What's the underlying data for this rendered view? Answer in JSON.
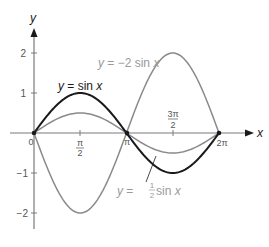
{
  "chart_data": {
    "type": "line",
    "title": "",
    "xlabel": "x",
    "ylabel": "y",
    "xlim": [
      0,
      6.9
    ],
    "ylim": [
      -2.4,
      2.6
    ],
    "x_ticks": [
      {
        "value": 0,
        "label": "0"
      },
      {
        "value": 1.5708,
        "label": "π/2"
      },
      {
        "value": 3.1416,
        "label": "π"
      },
      {
        "value": 4.7124,
        "label": "3π/2"
      },
      {
        "value": 6.2832,
        "label": "2π"
      }
    ],
    "y_ticks": [
      {
        "value": 2,
        "label": "2"
      },
      {
        "value": 1,
        "label": "1"
      },
      {
        "value": -1,
        "label": "−1"
      },
      {
        "value": -2,
        "label": "−2"
      }
    ],
    "x": [
      0,
      0.7854,
      1.5708,
      2.3562,
      3.1416,
      3.927,
      4.7124,
      5.4978,
      6.2832
    ],
    "series": [
      {
        "name": "y = sin x",
        "color": "#1a1a1a",
        "amplitude": 1,
        "values": [
          0,
          0.707,
          1,
          0.707,
          0,
          -0.707,
          -1,
          -0.707,
          0
        ]
      },
      {
        "name": "y = −2 sin x",
        "color": "#8a8a8a",
        "amplitude": -2,
        "values": [
          0,
          -1.414,
          -2,
          -1.414,
          0,
          1.414,
          2,
          1.414,
          0
        ]
      },
      {
        "name": "y = ½ sin x",
        "color": "#8a8a8a",
        "amplitude": 0.5,
        "values": [
          0,
          0.354,
          0.5,
          0.354,
          0,
          -0.354,
          -0.5,
          -0.354,
          0
        ]
      }
    ],
    "annotations": [
      {
        "text_parts": [
          "y",
          " = sin ",
          "x"
        ],
        "for": "y = sin x"
      },
      {
        "text_parts": [
          "y",
          " = −2 sin ",
          "x"
        ],
        "for": "y = −2 sin x"
      },
      {
        "text_parts": [
          "y",
          " = ",
          "1",
          "2",
          " sin ",
          "x"
        ],
        "for": "y = ½ sin x"
      }
    ],
    "points": [
      {
        "x": 0,
        "y": 0
      },
      {
        "x": 3.1416,
        "y": 0
      },
      {
        "x": 6.2832,
        "y": 0
      }
    ],
    "grid": false,
    "legend": "none (inline labels)"
  },
  "axis": {
    "x_label": "x",
    "y_label": "y"
  },
  "labels": {
    "sin": {
      "y": "y",
      "eq": " = sin ",
      "x": "x"
    },
    "neg2": {
      "y": "y",
      "eq": " = −2 sin ",
      "x": "x"
    },
    "half": {
      "y": "y",
      "eq": " = ",
      "num": "1",
      "den": "2",
      "sin": " sin ",
      "x": "x"
    }
  },
  "ticks": {
    "x0": "0",
    "pi_half_num": "π",
    "pi_half_den": "2",
    "pi": "π",
    "three_pi_half_num": "3π",
    "three_pi_half_den": "2",
    "two_pi": "2π",
    "y2": "2",
    "y1": "1",
    "ym1": "−1",
    "ym2": "−2"
  },
  "colors": {
    "axis": "#7a7a7a",
    "sin": "#1a1a1a",
    "scaled": "#8f8f8f",
    "label_dark": "#1a1a1a",
    "label_light": "#9a9a9a"
  }
}
